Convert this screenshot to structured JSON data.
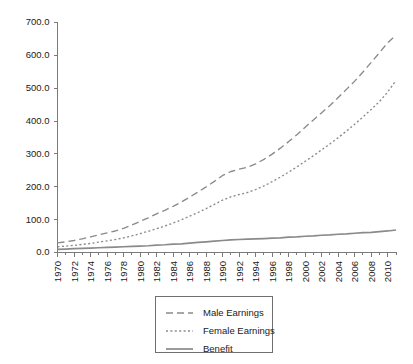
{
  "chart_data": {
    "type": "line",
    "title": "",
    "subtitle": "",
    "xlabel": "",
    "ylabel": "",
    "grid": false,
    "legend_position": "bottom-center",
    "xlim": [
      1970,
      2011
    ],
    "ylim": [
      0,
      700
    ],
    "ytick_labels": [
      "700.0",
      "600.0",
      "500.0",
      "400.0",
      "300.0",
      "200.0",
      "100.0",
      "0.0"
    ],
    "ytick_values": [
      700,
      600,
      500,
      400,
      300,
      200,
      100,
      0
    ],
    "xtick_labels": [
      "1970",
      "1972",
      "1974",
      "1976",
      "1978",
      "1980",
      "1982",
      "1984",
      "1986",
      "1988",
      "1990",
      "1992",
      "1994",
      "1996",
      "1998",
      "2000",
      "2002",
      "2004",
      "2006",
      "2008",
      "2010"
    ],
    "x": [
      1970,
      1971,
      1972,
      1973,
      1974,
      1975,
      1976,
      1977,
      1978,
      1979,
      1980,
      1981,
      1982,
      1983,
      1984,
      1985,
      1986,
      1987,
      1988,
      1989,
      1990,
      1991,
      1992,
      1993,
      1994,
      1995,
      1996,
      1997,
      1998,
      1999,
      2000,
      2001,
      2002,
      2003,
      2004,
      2005,
      2006,
      2007,
      2008,
      2009,
      2010,
      2011
    ],
    "series": [
      {
        "name": "Male Earnings",
        "style": "dashed",
        "color": "#8a8a8a",
        "values": [
          28,
          31,
          35,
          40,
          46,
          52,
          58,
          64,
          72,
          82,
          93,
          104,
          116,
          127,
          139,
          152,
          167,
          182,
          198,
          215,
          233,
          245,
          252,
          258,
          268,
          282,
          298,
          316,
          336,
          357,
          380,
          402,
          424,
          446,
          470,
          495,
          520,
          548,
          577,
          607,
          637,
          660
        ]
      },
      {
        "name": "Female Earnings",
        "style": "dotted",
        "color": "#8a8a8a",
        "values": [
          16,
          18,
          20,
          23,
          26,
          30,
          34,
          38,
          43,
          49,
          56,
          63,
          71,
          79,
          88,
          98,
          109,
          120,
          132,
          145,
          158,
          168,
          175,
          181,
          190,
          201,
          214,
          228,
          243,
          259,
          276,
          293,
          311,
          329,
          348,
          368,
          389,
          411,
          434,
          458,
          487,
          522
        ]
      },
      {
        "name": "Benefit",
        "style": "solid",
        "color": "#8a8a8a",
        "values": [
          8,
          9,
          10,
          11,
          12,
          13,
          14,
          15,
          16,
          17,
          18,
          19,
          21,
          22,
          24,
          25,
          27,
          29,
          31,
          33,
          35,
          37,
          38,
          39,
          40,
          41,
          42,
          43,
          45,
          46,
          48,
          49,
          51,
          52,
          54,
          55,
          57,
          59,
          60,
          62,
          64,
          67
        ]
      }
    ]
  },
  "legend": {
    "entries": [
      {
        "label": "Male Earnings",
        "style": "dashed"
      },
      {
        "label": "Female Earnings",
        "style": "dotted"
      },
      {
        "label": "Benefit",
        "style": "solid"
      }
    ]
  },
  "colors": {
    "background": "#ffffff",
    "axis": "#7a7a7a",
    "text": "#1a1a1a",
    "line": "#8a8a8a",
    "legend_border": "#6f6f6f"
  }
}
